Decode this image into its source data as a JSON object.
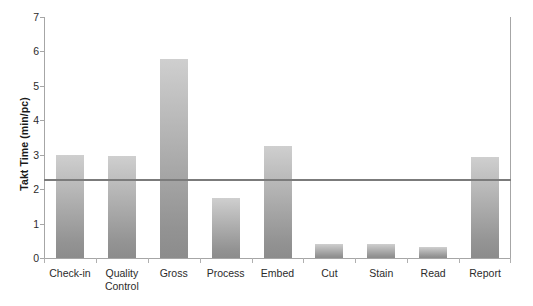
{
  "chart_data": {
    "type": "bar",
    "title": "",
    "subtitle": "",
    "xlabel": "",
    "ylabel": "Takt Time (min/pc)",
    "categories": [
      "Check-in",
      "Quality Control",
      "Gross",
      "Process",
      "Embed",
      "Cut",
      "Stain",
      "Read",
      "Report"
    ],
    "category_lines": [
      [
        "Check-in"
      ],
      [
        "Quality",
        "Control"
      ],
      [
        "Gross"
      ],
      [
        "Process"
      ],
      [
        "Embed"
      ],
      [
        "Cut"
      ],
      [
        "Stain"
      ],
      [
        "Read"
      ],
      [
        "Report"
      ]
    ],
    "values": [
      2.98,
      2.95,
      5.78,
      1.75,
      3.25,
      0.4,
      0.4,
      0.32,
      2.94
    ],
    "ylim": [
      0,
      7
    ],
    "ytick_labels": [
      "0",
      "1",
      "2",
      "3",
      "4",
      "5",
      "6",
      "7"
    ],
    "ytick_values": [
      0,
      1,
      2,
      3,
      4,
      5,
      6,
      7
    ],
    "grid": false,
    "legend": "none",
    "reference_line": {
      "name": "takt-time",
      "value": 2.27,
      "color": "#7b7b7b",
      "orientation": "horizontal"
    },
    "bar_color_top": "#cfcfcf",
    "bar_color_bottom": "#8c8c8c",
    "axis_color": "#a6a6a6",
    "text_color": "#2b2b2b"
  }
}
